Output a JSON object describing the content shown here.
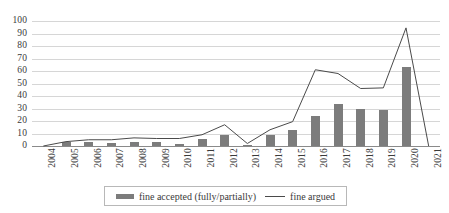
{
  "chart_data": {
    "type": "bar",
    "title": "",
    "subtitle": "",
    "xlabel": "",
    "ylabel": "",
    "ylim": [
      0,
      100
    ],
    "yticks": [
      0,
      10,
      20,
      30,
      40,
      50,
      60,
      70,
      80,
      90,
      100
    ],
    "grid": true,
    "legend_position": "bottom",
    "categories": [
      "2004",
      "2005",
      "2006",
      "2007",
      "2008",
      "2009",
      "2010",
      "2011",
      "2012",
      "2013",
      "2014",
      "2015",
      "2016",
      "2017",
      "2018",
      "2019",
      "2020",
      "2021"
    ],
    "series": [
      {
        "name": "fine accepted (fully/partially)",
        "type": "bar",
        "color": "#7c7c7c",
        "values": [
          0,
          3,
          3,
          2.5,
          3,
          3,
          2,
          6,
          9,
          1,
          9,
          13,
          24,
          33.5,
          29.5,
          28.5,
          63,
          0
        ]
      },
      {
        "name": "fine argued",
        "type": "line",
        "color": "#4a4a4a",
        "values": [
          0,
          3.5,
          5,
          5,
          6.5,
          6,
          6,
          9,
          17,
          2,
          13,
          19.5,
          61,
          58,
          46,
          46.5,
          94.5,
          0
        ]
      }
    ]
  },
  "legend": {
    "entries": [
      {
        "label": "fine accepted (fully/partially)",
        "marker": "bar-swatch"
      },
      {
        "label": "fine argued",
        "marker": "line-swatch"
      }
    ]
  },
  "axes": {
    "y_tick_labels": [
      "100",
      "90",
      "80",
      "70",
      "60",
      "50",
      "40",
      "30",
      "20",
      "10",
      "0"
    ],
    "x_tick_labels": [
      "2004",
      "2005",
      "2006",
      "2007",
      "2008",
      "2009",
      "2010",
      "2011",
      "2012",
      "2013",
      "2014",
      "2015",
      "2016",
      "2017",
      "2018",
      "2019",
      "2020",
      "2021"
    ]
  },
  "colors": {
    "bar": "#7c7c7c",
    "line": "#4a4a4a",
    "gridline": "#d6d6d6",
    "axis": "#8a8a8a",
    "text": "#3a3a3a",
    "background": "#ffffff"
  }
}
